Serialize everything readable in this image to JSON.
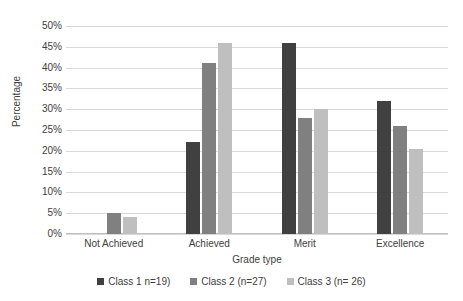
{
  "chart_data": {
    "type": "bar",
    "title": "",
    "xlabel": "Grade type",
    "ylabel": "Percentage",
    "categories": [
      "Not Achieved",
      "Achieved",
      "Merit",
      "Excellence"
    ],
    "series": [
      {
        "name": "Class 1 n=19)",
        "color": "#404040",
        "values": [
          0,
          22,
          46,
          32
        ]
      },
      {
        "name": "Class 2 (n=27)",
        "color": "#808080",
        "values": [
          5,
          41,
          28,
          26
        ]
      },
      {
        "name": "Class 3 (n= 26)",
        "color": "#bfbfbf",
        "values": [
          4,
          46,
          30,
          20.5
        ]
      }
    ],
    "ylim": [
      0,
      50
    ],
    "ytick_values": [
      0,
      5,
      10,
      15,
      20,
      25,
      30,
      35,
      40,
      45,
      50
    ],
    "ytick_labels": [
      "0%",
      "5%",
      "10%",
      "15%",
      "20%",
      "25%",
      "30%",
      "35%",
      "40%",
      "45%",
      "50%"
    ],
    "grid": true,
    "legend_position": "bottom",
    "gridline_color": "#d9d9d9",
    "background_color": "#ffffff",
    "text_color": "#404040"
  }
}
